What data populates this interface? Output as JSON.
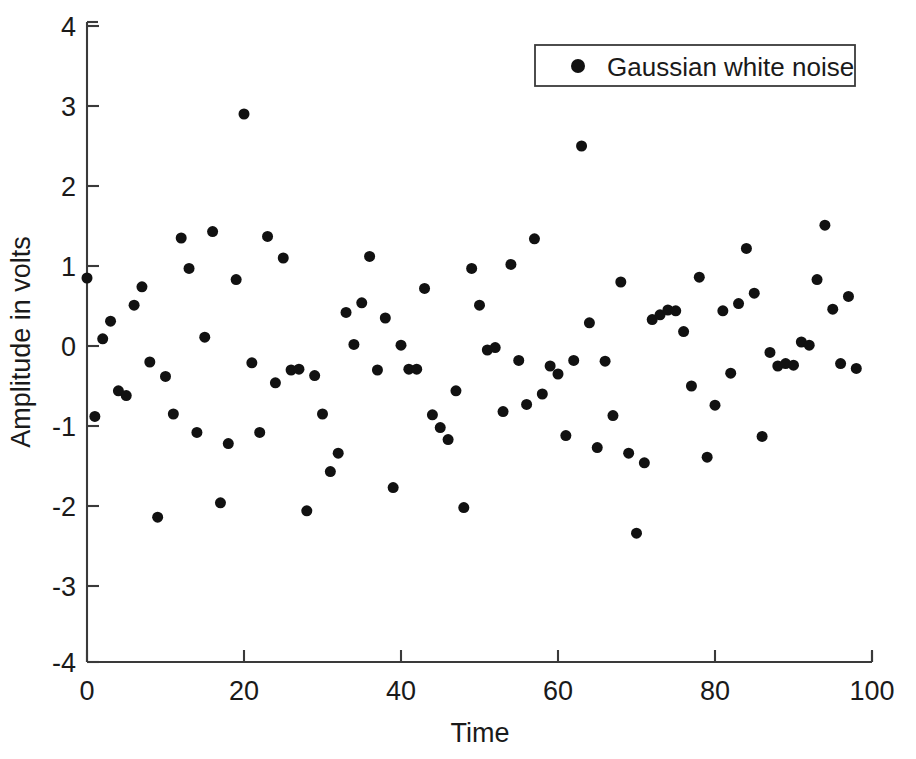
{
  "chart_data": {
    "type": "scatter",
    "title": "",
    "xlabel": "Time",
    "ylabel": "Amplitude in volts",
    "xlim": [
      0,
      100
    ],
    "ylim": [
      -4,
      4
    ],
    "xticks": [
      0,
      20,
      40,
      60,
      80,
      100
    ],
    "yticks": [
      -4,
      -3,
      -2,
      -1,
      0,
      1,
      2,
      3,
      4
    ],
    "xtick_labels": [
      "0",
      "20",
      "40",
      "60",
      "80",
      "100"
    ],
    "ytick_labels": [
      "-4",
      "-3",
      "-2",
      "-1",
      "0",
      "1",
      "2",
      "3",
      "4"
    ],
    "grid": false,
    "legend_position": "top-right",
    "marker_color": "#111111",
    "marker_shape": "circle",
    "marker_size": 11,
    "series": [
      {
        "name": "Gaussian white noise",
        "x": [
          0,
          1,
          2,
          3,
          4,
          5,
          6,
          7,
          8,
          9,
          10,
          11,
          12,
          13,
          14,
          15,
          16,
          17,
          18,
          19,
          20,
          21,
          22,
          23,
          24,
          25,
          26,
          27,
          28,
          29,
          30,
          31,
          32,
          33,
          34,
          35,
          36,
          37,
          38,
          39,
          40,
          41,
          42,
          43,
          44,
          45,
          46,
          47,
          48,
          49,
          50,
          51,
          52,
          53,
          54,
          55,
          56,
          57,
          58,
          59,
          60,
          61,
          62,
          63,
          64,
          65,
          66,
          67,
          68,
          69,
          70,
          71,
          72,
          73,
          74,
          75,
          76,
          77,
          78,
          79,
          80,
          81,
          82,
          83,
          84,
          85,
          86,
          87,
          88,
          89,
          90,
          91,
          92,
          93,
          94,
          95,
          96,
          97,
          98
        ],
        "y": [
          0.85,
          -0.88,
          0.09,
          0.31,
          -0.56,
          -0.62,
          0.51,
          0.74,
          -0.2,
          -2.14,
          -0.38,
          -0.85,
          1.35,
          0.97,
          -1.08,
          0.11,
          1.43,
          -1.96,
          -1.22,
          0.83,
          2.9,
          -0.21,
          -1.08,
          1.37,
          -0.46,
          1.1,
          -0.3,
          -0.29,
          -2.06,
          -0.37,
          -0.85,
          -1.57,
          -1.34,
          0.42,
          0.02,
          0.54,
          1.12,
          -0.3,
          0.35,
          -1.77,
          0.01,
          -0.29,
          -0.29,
          0.72,
          -0.86,
          -1.02,
          -1.17,
          -0.56,
          -2.02,
          0.97,
          0.51,
          -0.05,
          -0.02,
          -0.82,
          1.02,
          -0.18,
          -0.73,
          1.34,
          -0.6,
          -0.25,
          -0.35,
          -1.12,
          -0.18,
          2.5,
          0.29,
          -1.27,
          -0.19,
          -0.87,
          0.8,
          -1.34,
          -2.34,
          -1.46,
          0.33,
          0.39,
          0.45,
          0.44,
          0.18,
          -0.5,
          0.86,
          -1.39,
          -0.74,
          0.44,
          -0.34,
          0.53,
          1.22,
          0.66,
          -1.13,
          -0.08,
          -0.25,
          -0.22,
          -0.24,
          0.05,
          0.01,
          0.83,
          1.51,
          0.46,
          -0.22,
          0.62,
          -0.28
        ]
      }
    ]
  },
  "legend": {
    "entries": [
      {
        "label": "Gaussian white noise",
        "marker": "filled-circle-marker",
        "color": "#111111"
      }
    ]
  },
  "axes": {
    "x_title": "Time",
    "y_title": "Amplitude in volts"
  }
}
